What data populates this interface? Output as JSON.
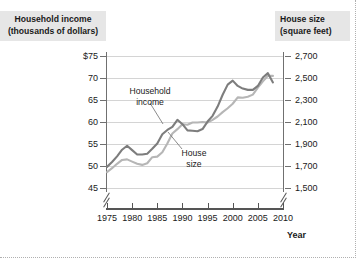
{
  "chart_data": {
    "type": "line",
    "title": "",
    "xlabel": "Year",
    "x": [
      1975,
      1976,
      1977,
      1978,
      1979,
      1980,
      1981,
      1982,
      1983,
      1984,
      1985,
      1986,
      1987,
      1988,
      1989,
      1990,
      1991,
      1992,
      1993,
      1994,
      1995,
      1996,
      1997,
      1998,
      1999,
      2000,
      2001,
      2002,
      2003,
      2004,
      2005,
      2006,
      2007,
      2008
    ],
    "xlim": [
      1975,
      2010
    ],
    "xticks": [
      1975,
      1980,
      1985,
      1990,
      1995,
      2000,
      2005,
      2010
    ],
    "xtick_labels": [
      "1975",
      "1980",
      "1985",
      "1990",
      "1995",
      "2000",
      "2005",
      "2010"
    ],
    "grid": "horizontal",
    "axis_break_x": true,
    "axis_break_y": true,
    "legend_position": "inline-annotations",
    "series": [
      {
        "name": "Household income",
        "axis": "left",
        "color": "#7d7d7d",
        "unit": "thousands of dollars",
        "values": [
          49.8,
          50.9,
          52.2,
          53.7,
          54.6,
          53.6,
          52.6,
          52.6,
          52.8,
          53.9,
          55.1,
          57.2,
          58.2,
          58.9,
          60.5,
          59.5,
          58.1,
          58.0,
          57.9,
          58.4,
          60.1,
          61.4,
          63.5,
          66.2,
          68.5,
          69.4,
          68.2,
          67.6,
          67.3,
          67.3,
          68.2,
          70.1,
          71.1,
          69.0
        ]
      },
      {
        "name": "House size",
        "axis": "right",
        "color": "#b6b6b6",
        "unit": "square feet",
        "values": [
          1645,
          1680,
          1720,
          1755,
          1760,
          1740,
          1720,
          1710,
          1725,
          1780,
          1785,
          1825,
          1905,
          1995,
          2035,
          2080,
          2075,
          2095,
          2095,
          2100,
          2095,
          2120,
          2150,
          2190,
          2225,
          2266,
          2324,
          2320,
          2330,
          2349,
          2412,
          2469,
          2521,
          2519
        ]
      }
    ],
    "left_axis": {
      "label_line1": "Household income",
      "label_line2": "(thousands of dollars)",
      "ticks": [
        "$75",
        "70",
        "65",
        "60",
        "55",
        "50",
        "45"
      ],
      "tick_values": [
        75,
        70,
        65,
        60,
        55,
        50,
        45
      ],
      "ylim": [
        45,
        75
      ]
    },
    "right_axis": {
      "label_line1": "House size",
      "label_line2": "(square feet)",
      "ticks": [
        "2,700",
        "2,500",
        "2,300",
        "2,100",
        "1,900",
        "1,700",
        "1,500"
      ],
      "tick_values": [
        2700,
        2500,
        2300,
        2100,
        1900,
        1700,
        1500
      ],
      "ylim": [
        1500,
        2700
      ]
    },
    "annotations": [
      {
        "text_line1": "Household",
        "text_line2": "income",
        "series": "Household income"
      },
      {
        "text_line1": "House",
        "text_line2": "size",
        "series": "House size"
      }
    ],
    "colors": {
      "household_income_line": "#7d7d7d",
      "house_size_line": "#b6b6b6",
      "gridline": "#d4d4d4",
      "axis": "#555555",
      "title_background": "#e6e6e6",
      "text": "#1a1a1a"
    }
  },
  "left_axis_title": {
    "line1": "Household income",
    "line2": "(thousands of dollars)"
  },
  "right_axis_title": {
    "line1": "House size",
    "line2": "(square feet)"
  },
  "x_axis_title": "Year",
  "y_ticks_left": [
    {
      "label": "$75"
    },
    {
      "label": "70"
    },
    {
      "label": "65"
    },
    {
      "label": "60"
    },
    {
      "label": "55"
    },
    {
      "label": "50"
    },
    {
      "label": "45"
    }
  ],
  "y_ticks_right": [
    {
      "label": "2,700"
    },
    {
      "label": "2,500"
    },
    {
      "label": "2,300"
    },
    {
      "label": "2,100"
    },
    {
      "label": "1,900"
    },
    {
      "label": "1,700"
    },
    {
      "label": "1,500"
    }
  ],
  "x_ticks": [
    {
      "label": "1975"
    },
    {
      "label": "1980"
    },
    {
      "label": "1985"
    },
    {
      "label": "1990"
    },
    {
      "label": "1995"
    },
    {
      "label": "2000"
    },
    {
      "label": "2005"
    },
    {
      "label": "2010"
    }
  ],
  "annotations": {
    "household_income": {
      "line1": "Household",
      "line2": "income"
    },
    "house_size": {
      "line1": "House",
      "line2": "size"
    }
  }
}
